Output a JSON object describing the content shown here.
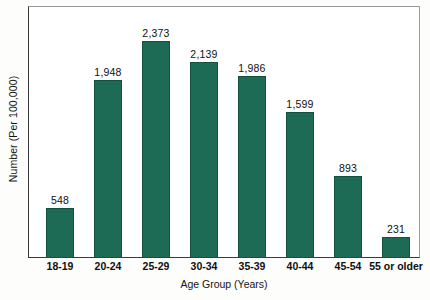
{
  "chart_data": {
    "type": "bar",
    "title": "",
    "xlabel": "Age Group (Years)",
    "ylabel": "Number (Per 100,000)",
    "categories": [
      "18-19",
      "20-24",
      "25-29",
      "30-34",
      "35-39",
      "40-44",
      "45-54",
      "55 or older"
    ],
    "values": [
      548,
      1948,
      2373,
      2139,
      1986,
      1599,
      893,
      231
    ],
    "value_labels": [
      "548",
      "1,948",
      "2,373",
      "2,139",
      "1,986",
      "1,599",
      "893",
      "231"
    ],
    "ylim": [
      0,
      2556
    ],
    "grid": false,
    "legend": null,
    "bar_color": "#1d6b54",
    "frame_color": "#8b8b8b",
    "axis_tick_labels_y": []
  },
  "axes": {
    "y_title": "Number (Per 100,000)",
    "x_title": "Age Group (Years)"
  }
}
